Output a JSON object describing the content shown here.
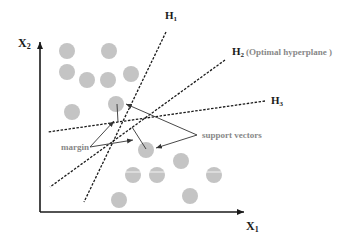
{
  "axes": {
    "x_label": "X",
    "x_sub": "1",
    "y_label": "X",
    "y_sub": "2"
  },
  "hyperplanes": [
    {
      "id": "H1",
      "label": "H",
      "sub": "1",
      "note": ""
    },
    {
      "id": "H2",
      "label": "H",
      "sub": "2",
      "note": "(Optimal hyperplane )"
    },
    {
      "id": "H3",
      "label": "H",
      "sub": "3",
      "note": ""
    }
  ],
  "annotations": {
    "margin": "margin",
    "support_vectors": "support vectors"
  },
  "colors": {
    "point": "#c4c4c4",
    "axis": "#1a1a1a",
    "line": "#1a1a1a",
    "annotation_text": "#888888"
  }
}
